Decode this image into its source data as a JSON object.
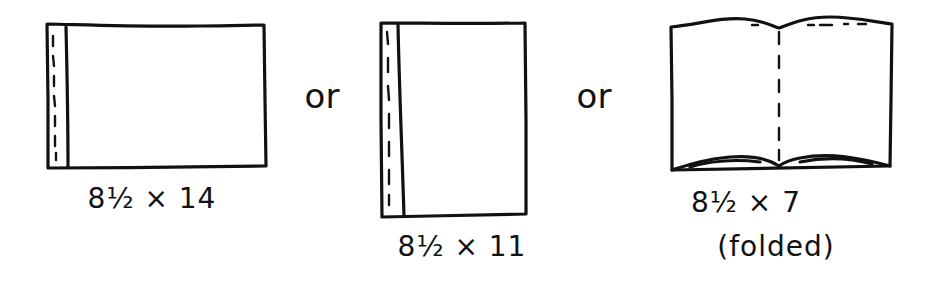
{
  "diagram": {
    "items": [
      {
        "id": "landscape",
        "label": "8½ × 14",
        "description": "bound on short side, landscape",
        "note": ""
      },
      {
        "id": "portrait",
        "label": "8½ × 11",
        "description": "bound on long side, portrait",
        "note": ""
      },
      {
        "id": "folded",
        "label": "8½ × 7",
        "description": "open book, folded at center",
        "note": "(folded)"
      }
    ],
    "separators": [
      "or",
      "or"
    ],
    "colors": {
      "ink": "#111111",
      "paper": "#ffffff"
    }
  }
}
